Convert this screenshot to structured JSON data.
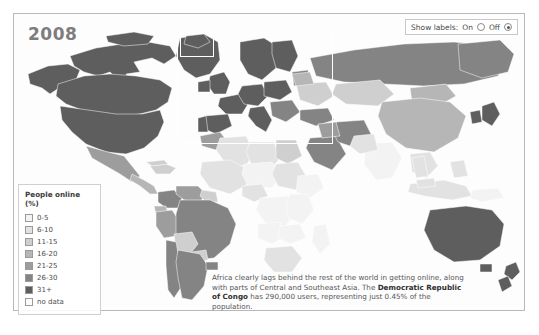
{
  "chart_data": {
    "type": "heatmap",
    "title": "2008",
    "subtitle": "",
    "metric": "People online (%)",
    "legend_position": "bottom-left",
    "grid": false,
    "categories": [
      "0-5",
      "6-10",
      "11-15",
      "16-20",
      "21-25",
      "26-30",
      "31+",
      "no data"
    ],
    "colors": [
      "#f3f3f3",
      "#e2e2e2",
      "#cfcfcf",
      "#b6b6b6",
      "#9d9d9d",
      "#848484",
      "#5e5e5e",
      "#fbfbfb"
    ],
    "annotation": "Africa clearly lags behind the rest of the world in getting online, along with parts of Central and Southeast Asia. The Democratic Republic of Congo has 290,000 users, representing just 0.45% of the population.",
    "highlight_country": "Democratic Republic of Congo",
    "highlight_users": "290,000",
    "highlight_share": "0.45%",
    "regions": [
      {
        "name": "Canada",
        "band": "31+"
      },
      {
        "name": "United States",
        "band": "31+"
      },
      {
        "name": "Greenland",
        "band": "31+"
      },
      {
        "name": "Mexico",
        "band": "21-25"
      },
      {
        "name": "Brazil",
        "band": "26-30"
      },
      {
        "name": "Argentina",
        "band": "26-30"
      },
      {
        "name": "Chile",
        "band": "26-30"
      },
      {
        "name": "Peru",
        "band": "21-25"
      },
      {
        "name": "Colombia",
        "band": "26-30"
      },
      {
        "name": "Venezuela",
        "band": "21-25"
      },
      {
        "name": "Bolivia",
        "band": "11-15"
      },
      {
        "name": "Paraguay",
        "band": "11-15"
      },
      {
        "name": "Western Europe",
        "band": "31+"
      },
      {
        "name": "Scandinavia",
        "band": "31+"
      },
      {
        "name": "United Kingdom",
        "band": "31+"
      },
      {
        "name": "Russia",
        "band": "26-30"
      },
      {
        "name": "Ukraine",
        "band": "11-15"
      },
      {
        "name": "Kazakhstan",
        "band": "11-15"
      },
      {
        "name": "China",
        "band": "16-20"
      },
      {
        "name": "Japan",
        "band": "31+"
      },
      {
        "name": "South Korea",
        "band": "31+"
      },
      {
        "name": "India",
        "band": "0-5"
      },
      {
        "name": "Pakistan",
        "band": "6-10"
      },
      {
        "name": "Saudi Arabia",
        "band": "26-30"
      },
      {
        "name": "Iran",
        "band": "26-30"
      },
      {
        "name": "Turkey",
        "band": "26-30"
      },
      {
        "name": "Australia",
        "band": "31+"
      },
      {
        "name": "New Zealand",
        "band": "31+"
      },
      {
        "name": "Indonesia",
        "band": "6-10"
      },
      {
        "name": "Democratic Republic of Congo",
        "band": "0-5"
      },
      {
        "name": "Nigeria",
        "band": "6-10"
      },
      {
        "name": "Ethiopia",
        "band": "0-5"
      },
      {
        "name": "South Africa",
        "band": "6-10"
      },
      {
        "name": "Egypt",
        "band": "11-15"
      },
      {
        "name": "Morocco",
        "band": "21-25"
      },
      {
        "name": "Algeria",
        "band": "6-10"
      },
      {
        "name": "Libya",
        "band": "6-10"
      },
      {
        "name": "Sudan",
        "band": "6-10"
      },
      {
        "name": "Greenland Ice",
        "band": "no data"
      }
    ]
  },
  "header": {
    "year": "2008"
  },
  "controls": {
    "labels_label": "Show labels:",
    "on_label": "On",
    "off_label": "Off",
    "selected": "Off"
  },
  "legend": {
    "title": "People online (%)",
    "items": [
      {
        "label": "0-5",
        "color": "#f3f3f3"
      },
      {
        "label": "6-10",
        "color": "#e2e2e2"
      },
      {
        "label": "11-15",
        "color": "#cfcfcf"
      },
      {
        "label": "16-20",
        "color": "#b6b6b6"
      },
      {
        "label": "21-25",
        "color": "#9d9d9d"
      },
      {
        "label": "26-30",
        "color": "#848484"
      },
      {
        "label": "31+",
        "color": "#5e5e5e"
      },
      {
        "label": "no data",
        "color": "#fbfbfb"
      }
    ]
  },
  "note": {
    "part1": "Africa clearly lags behind the rest of the world in getting online, along with parts of Central and Southeast Asia. The ",
    "bold": "Democratic Republic of Congo",
    "part2": " has 290,000 users, representing just 0.45% of the population."
  }
}
